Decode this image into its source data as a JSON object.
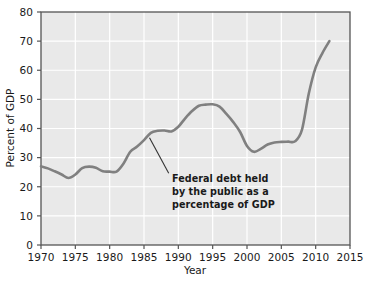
{
  "chart_data": {
    "type": "line",
    "title": "",
    "subtitle": "",
    "xlabel": "Year",
    "ylabel": "Percent of GDP",
    "xlim": [
      1970,
      2015
    ],
    "ylim": [
      0,
      80
    ],
    "xticks": [
      1970,
      1975,
      1980,
      1985,
      1990,
      1995,
      2000,
      2005,
      2010,
      2015
    ],
    "yticks": [
      0,
      10,
      20,
      30,
      40,
      50,
      60,
      70,
      80
    ],
    "xtick_labels": [
      "1970",
      "1975",
      "1980",
      "1985",
      "1990",
      "1995",
      "2000",
      "2005",
      "2010",
      "2015"
    ],
    "ytick_labels": [
      "0",
      "10",
      "20",
      "30",
      "40",
      "50",
      "60",
      "70",
      "80"
    ],
    "grid": true,
    "legend": null,
    "legend_position": "none",
    "plot_background": "#e9e9e9",
    "grid_color": "#ffffff",
    "line_color": "#808080",
    "line_width": 2.6,
    "series": [
      {
        "name": "Federal debt held by the public as a percentage of GDP",
        "x": [
          1970,
          1971,
          1972,
          1973,
          1974,
          1975,
          1976,
          1977,
          1978,
          1979,
          1980,
          1981,
          1982,
          1983,
          1984,
          1985,
          1986,
          1987,
          1988,
          1989,
          1990,
          1991,
          1992,
          1993,
          1994,
          1995,
          1996,
          1997,
          1998,
          1999,
          2000,
          2001,
          2002,
          2003,
          2004,
          2005,
          2006,
          2007,
          2008,
          2009,
          2010,
          2011,
          2012
        ],
        "values": [
          27.0,
          26.3,
          25.3,
          24.2,
          23.0,
          24.2,
          26.4,
          26.9,
          26.5,
          25.3,
          25.2,
          25.2,
          27.9,
          32.0,
          33.8,
          36.0,
          38.5,
          39.2,
          39.3,
          39.0,
          40.6,
          43.5,
          46.0,
          47.8,
          48.2,
          48.3,
          47.5,
          45.0,
          42.2,
          38.8,
          34.0,
          32.0,
          33.0,
          34.5,
          35.2,
          35.4,
          35.5,
          35.6,
          39.5,
          52.0,
          61.0,
          66.0,
          70.0
        ]
      }
    ],
    "annotations": [
      {
        "id": "federal-debt-annotation",
        "lines": [
          "Federal debt held",
          "by the public as a",
          "percentage of GDP"
        ],
        "text": "Federal debt held by the public as a percentage of GDP",
        "leader_from_x": 1985.8,
        "leader_from_y": 36.8,
        "leader_to_x": 1988.6,
        "leader_to_y": 24.6
      }
    ]
  }
}
